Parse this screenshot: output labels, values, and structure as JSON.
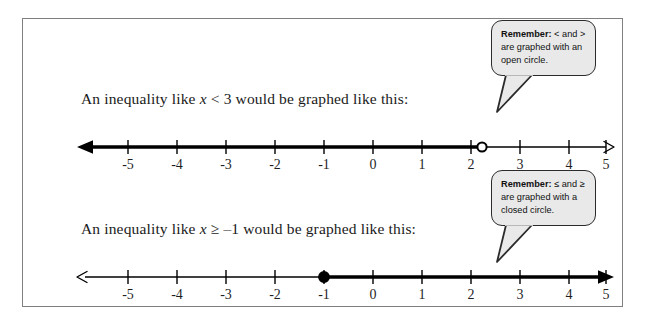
{
  "page": {
    "background_color": "#ffffff",
    "frame_border_color": "#808080"
  },
  "examples": [
    {
      "statement_prefix": "An inequality like ",
      "variable": "x",
      "relation": " < 3",
      "statement_suffix": " would be graphed like this:",
      "full_statement": "An inequality like x < 3 would be graphed like this:",
      "callout": {
        "lead": "Remember:",
        "body": " < and > are graphed with an open circle.",
        "full_text": "Remember: < and > are graphed with an open circle.",
        "fill_color": "#e9e9e9",
        "border_color": "#2b2b2b"
      },
      "number_line": {
        "min": -5,
        "max": 5,
        "tick_labels": [
          "-5",
          "-4",
          "-3",
          "-2",
          "-1",
          "0",
          "1",
          "2",
          "3",
          "4",
          "5"
        ],
        "endpoint_value": 3,
        "endpoint_style": "open-circle",
        "shaded_direction": "left",
        "left_arrow": "filled",
        "right_arrow": "thin",
        "line_color": "#000000"
      }
    },
    {
      "statement_prefix": "An inequality like ",
      "variable": "x",
      "relation": " ≥ –1",
      "statement_suffix": " would be graphed like this:",
      "full_statement": "An inequality like x ≥ –1 would be graphed like this:",
      "callout": {
        "lead": "Remember:",
        "body": " ≤ and ≥ are graphed with a closed circle.",
        "full_text": "Remember: ≤ and ≥ are graphed with a closed circle.",
        "fill_color": "#e9e9e9",
        "border_color": "#2b2b2b"
      },
      "number_line": {
        "min": -5,
        "max": 5,
        "tick_labels": [
          "-5",
          "-4",
          "-3",
          "-2",
          "-1",
          "0",
          "1",
          "2",
          "3",
          "4",
          "5"
        ],
        "endpoint_value": -1,
        "endpoint_style": "closed-circle",
        "shaded_direction": "right",
        "left_arrow": "thin",
        "right_arrow": "filled",
        "line_color": "#000000"
      }
    }
  ]
}
